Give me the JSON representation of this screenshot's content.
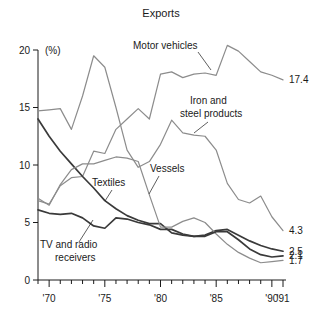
{
  "chart_data": {
    "type": "line",
    "title": "Exports",
    "xlabel": "",
    "ylabel": "(%)",
    "ylim": [
      0,
      20
    ],
    "xlim": [
      1969,
      1991
    ],
    "yticks": [
      0,
      5,
      10,
      15,
      20
    ],
    "ytick_labels": [
      "0",
      "5",
      "10",
      "15",
      "20"
    ],
    "xticks": [
      1970,
      1975,
      1980,
      1985,
      1990,
      1991
    ],
    "xtick_labels": [
      "'70",
      "'75",
      "'80",
      "'85",
      "'90",
      "'91"
    ],
    "grid": false,
    "legend": "inline-annotations",
    "x": [
      1969,
      1970,
      1971,
      1972,
      1973,
      1974,
      1975,
      1976,
      1977,
      1978,
      1979,
      1980,
      1981,
      1982,
      1983,
      1984,
      1985,
      1986,
      1987,
      1988,
      1989,
      1990,
      1991
    ],
    "series": [
      {
        "name": "Motor vehicles",
        "color": "#8c8c8c",
        "end_value": 17.4,
        "end_label": "17.4",
        "values": [
          6.9,
          6.6,
          8.2,
          8.9,
          9.0,
          11.2,
          11.0,
          13.1,
          14.0,
          14.9,
          14.0,
          17.9,
          18.1,
          17.6,
          17.9,
          18.0,
          17.8,
          20.4,
          19.9,
          19.0,
          18.1,
          17.8,
          17.4
        ]
      },
      {
        "name": "Iron and steel products",
        "color": "#8c8c8c",
        "end_value": 4.3,
        "end_label": "4.3",
        "values": [
          14.7,
          14.8,
          14.9,
          13.1,
          16.0,
          19.5,
          18.5,
          15.0,
          11.3,
          9.8,
          10.3,
          11.8,
          13.9,
          12.8,
          12.6,
          12.5,
          11.3,
          8.4,
          7.0,
          6.7,
          7.3,
          5.5,
          4.3
        ]
      },
      {
        "name": "Textiles",
        "color": "#3a3a3a",
        "end_value": 2.5,
        "end_label": "2.5",
        "values": [
          14.0,
          12.5,
          11.2,
          10.1,
          9.0,
          8.0,
          6.9,
          6.2,
          5.6,
          5.2,
          4.9,
          4.9,
          4.1,
          3.9,
          3.8,
          3.9,
          4.3,
          4.4,
          3.9,
          3.4,
          3.0,
          2.7,
          2.5
        ]
      },
      {
        "name": "Vessels",
        "color": "#8c8c8c",
        "end_value": 1.7,
        "end_label": "1.7",
        "values": [
          7.1,
          6.5,
          8.3,
          9.6,
          10.1,
          10.1,
          10.4,
          10.7,
          10.6,
          10.3,
          7.4,
          4.6,
          4.6,
          5.1,
          5.4,
          5.0,
          4.0,
          3.1,
          2.4,
          1.9,
          1.5,
          1.6,
          1.7
        ]
      },
      {
        "name": "TV and radio receivers",
        "color": "#3a3a3a",
        "end_value": 2.1,
        "end_label": "2.1",
        "values": [
          6.1,
          5.8,
          5.7,
          5.8,
          5.4,
          4.7,
          4.5,
          5.4,
          5.3,
          5.0,
          4.8,
          4.4,
          4.4,
          4.0,
          3.8,
          3.8,
          4.2,
          4.2,
          3.5,
          2.7,
          2.2,
          2.0,
          2.1
        ]
      }
    ],
    "annotations": [
      {
        "text": "Motor vehicles",
        "x": 133,
        "y": 49,
        "leader": "M 198 52 L 211 70"
      },
      {
        "text": "Iron and",
        "x": 190,
        "y": 104,
        "leader": "M 208 122 L 194 133"
      },
      {
        "text": "steel products",
        "x": 180,
        "y": 117,
        "leader": ""
      },
      {
        "text": "Vessels",
        "x": 150,
        "y": 172,
        "leader": "M 159 176 L 149 194"
      },
      {
        "text": "Textiles",
        "x": 92,
        "y": 186,
        "leader": "M 112 190 L 105 201"
      },
      {
        "text": "TV and radio",
        "x": 40,
        "y": 248,
        "leader": "M 79 242 L 93 220"
      },
      {
        "text": "receivers",
        "x": 55,
        "y": 261,
        "leader": ""
      }
    ]
  }
}
